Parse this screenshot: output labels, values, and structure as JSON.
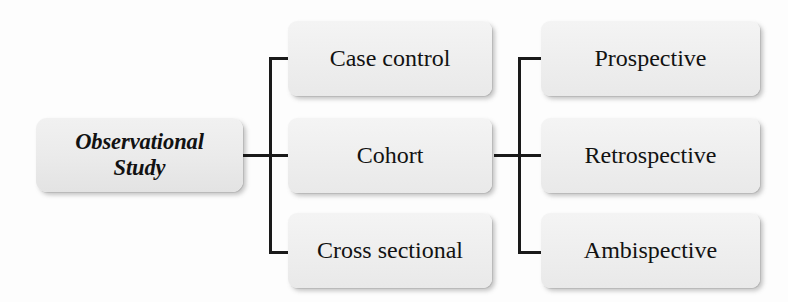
{
  "diagram": {
    "root": {
      "label": "Observational\nStudy",
      "line1": "Observational",
      "line2": "Study"
    },
    "level1": [
      {
        "id": "case-control",
        "label": "Case control"
      },
      {
        "id": "cohort",
        "label": "Cohort"
      },
      {
        "id": "cross-sectional",
        "label": "Cross sectional"
      }
    ],
    "level2": [
      {
        "id": "prospective",
        "label": "Prospective"
      },
      {
        "id": "retrospective",
        "label": "Retrospective"
      },
      {
        "id": "ambispective",
        "label": "Ambispective"
      }
    ],
    "colors": {
      "box_fill": "#efefef",
      "box_fill_top": "#f4f4f4",
      "box_fill_bottom": "#e9e9e9",
      "connector": "#1a1a1a",
      "text": "#121212",
      "background": "#fdfdfd",
      "shadow": "rgba(120,120,120,0.42)"
    }
  }
}
